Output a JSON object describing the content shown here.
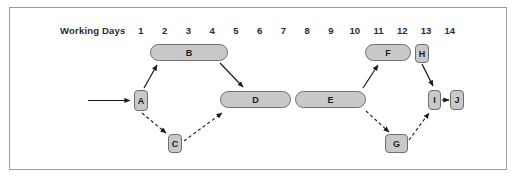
{
  "diagram": {
    "axis": {
      "label": "Working Days",
      "ticks": [
        "1",
        "2",
        "3",
        "4",
        "5",
        "6",
        "7",
        "8",
        "9",
        "10",
        "11",
        "12",
        "13",
        "14"
      ]
    },
    "colors": {
      "node_fill": "#c9c9c9",
      "node_stroke": "#6f6f6f",
      "frame_stroke": "#9a9a9a",
      "arrow": "#1a1a1a",
      "text": "#1d1d1d",
      "background": "#ffffff"
    },
    "nodes": [
      {
        "id": "A",
        "label": "A",
        "shape": "chip",
        "x": 134,
        "y": 90,
        "w": 14,
        "h": 21,
        "start_day": 1,
        "end_day": 1
      },
      {
        "id": "B",
        "label": "B",
        "shape": "pill",
        "x": 150,
        "y": 44,
        "w": 78,
        "h": 17,
        "start_day": 1,
        "end_day": 4
      },
      {
        "id": "C",
        "label": "C",
        "shape": "chip",
        "x": 168,
        "y": 134,
        "w": 14,
        "h": 19,
        "start_day": 2,
        "end_day": 2
      },
      {
        "id": "D",
        "label": "D",
        "shape": "pill",
        "x": 220,
        "y": 91,
        "w": 71,
        "h": 17,
        "start_day": 4,
        "end_day": 7
      },
      {
        "id": "E",
        "label": "E",
        "shape": "pill",
        "x": 295,
        "y": 91,
        "w": 71,
        "h": 17,
        "start_day": 7,
        "end_day": 10
      },
      {
        "id": "F",
        "label": "F",
        "shape": "pill",
        "x": 365,
        "y": 44,
        "w": 46,
        "h": 17,
        "start_day": 10,
        "end_day": 12
      },
      {
        "id": "G",
        "label": "G",
        "shape": "chip",
        "x": 385,
        "y": 134,
        "w": 23,
        "h": 19,
        "start_day": 11,
        "end_day": 12
      },
      {
        "id": "H",
        "label": "H",
        "shape": "chip",
        "x": 415,
        "y": 44,
        "w": 14,
        "h": 19,
        "start_day": 12,
        "end_day": 12
      },
      {
        "id": "I",
        "label": "I",
        "shape": "chip",
        "x": 428,
        "y": 90,
        "w": 13,
        "h": 20,
        "start_day": 13,
        "end_day": 13
      },
      {
        "id": "J",
        "label": "J",
        "shape": "chip",
        "x": 450,
        "y": 90,
        "w": 14,
        "h": 20,
        "start_day": 14,
        "end_day": 14
      }
    ],
    "edges": [
      {
        "id": "start-A",
        "from": "start",
        "to": "A",
        "style": "solid"
      },
      {
        "id": "A-B",
        "from": "A",
        "to": "B",
        "style": "solid"
      },
      {
        "id": "A-C",
        "from": "A",
        "to": "C",
        "style": "dashed"
      },
      {
        "id": "B-D",
        "from": "B",
        "to": "D",
        "style": "solid"
      },
      {
        "id": "C-D",
        "from": "C",
        "to": "D",
        "style": "dashed"
      },
      {
        "id": "E-F",
        "from": "E",
        "to": "F",
        "style": "solid"
      },
      {
        "id": "E-G",
        "from": "E",
        "to": "G",
        "style": "dashed"
      },
      {
        "id": "H-I",
        "from": "H",
        "to": "I",
        "style": "solid"
      },
      {
        "id": "G-I",
        "from": "G",
        "to": "I",
        "style": "dashed"
      },
      {
        "id": "I-J",
        "from": "I",
        "to": "J",
        "style": "solid"
      }
    ]
  },
  "chart_data": {
    "type": "bar",
    "title": "",
    "xlabel": "Working Days",
    "ylabel": "",
    "categories": [
      "A",
      "B",
      "C",
      "D",
      "E",
      "F",
      "G",
      "H",
      "I",
      "J"
    ],
    "series": [
      {
        "name": "start_day",
        "values": [
          1,
          1,
          2,
          4,
          7,
          10,
          11,
          12,
          13,
          14
        ]
      },
      {
        "name": "end_day",
        "values": [
          1,
          4,
          2,
          7,
          10,
          12,
          12,
          12,
          13,
          14
        ]
      }
    ],
    "xlim": [
      1,
      14
    ],
    "grid": false,
    "legend": "none",
    "annotations": [
      "A precedes B (solid)",
      "A precedes C (dashed)",
      "B precedes D (solid)",
      "C precedes D (dashed)",
      "E precedes F (solid)",
      "E precedes G (dashed)",
      "H precedes I (solid)",
      "G precedes I (dashed)",
      "I precedes J (solid)"
    ]
  }
}
